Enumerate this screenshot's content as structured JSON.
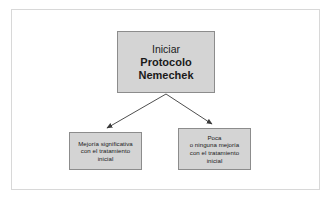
{
  "diagram": {
    "type": "flowchart",
    "language": "es",
    "colors": {
      "node_fill": "#d4d4d4",
      "node_border": "#8c8c8c",
      "connector": "#3a3a3a",
      "frame_border": "#d8d8d8",
      "background": "#ffffff",
      "text": "#1a1a1a"
    },
    "nodes": [
      {
        "id": "root",
        "name": "iniciar-protocolo-nemechek",
        "lines": [
          {
            "text": "Iniciar",
            "bold": false
          },
          {
            "text": "Protocolo",
            "bold": true
          },
          {
            "text": "Nemechek",
            "bold": true
          }
        ]
      },
      {
        "id": "left",
        "name": "mejoria-significativa",
        "lines": [
          {
            "text": "Mejoría significativa",
            "bold": false
          },
          {
            "text": "con el tratamiento",
            "bold": false
          },
          {
            "text": "inicial",
            "bold": false
          }
        ]
      },
      {
        "id": "right",
        "name": "poca-o-ninguna-mejoria",
        "lines": [
          {
            "text": "Poca",
            "bold": false
          },
          {
            "text": "o ninguna mejoría",
            "bold": false
          },
          {
            "text": "con el tratamiento",
            "bold": false
          },
          {
            "text": "inicial",
            "bold": false
          }
        ]
      }
    ],
    "connectors": [
      {
        "from": "root",
        "to": "left",
        "style": "arrow"
      },
      {
        "from": "root",
        "to": "right",
        "style": "arrow"
      }
    ]
  }
}
